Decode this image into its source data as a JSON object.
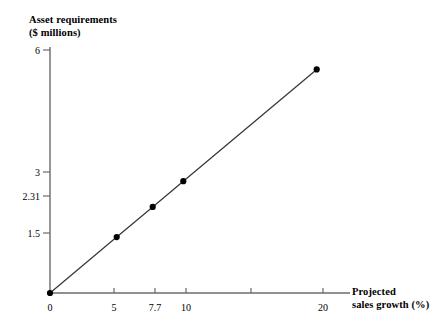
{
  "chart_data": {
    "type": "line",
    "title": "",
    "ylabel": "Asset requirements\n($ millions)",
    "ylabel_line1": "Asset requirements",
    "ylabel_line2": "($ millions)",
    "xlabel": "Projected\nsales growth (%)",
    "xlabel_line1": "Projected",
    "xlabel_line2": "sales growth (%)",
    "x": [
      0,
      5,
      7.7,
      10,
      20
    ],
    "values": [
      0,
      1.5,
      2.31,
      3,
      6
    ],
    "series": [
      {
        "name": "Asset requirements",
        "x": [
          0,
          5,
          7.7,
          10,
          20
        ],
        "values": [
          0,
          1.5,
          2.31,
          3,
          6
        ]
      }
    ],
    "points": [
      {
        "x": 0,
        "y": 0
      },
      {
        "x": 5,
        "y": 1.5
      },
      {
        "x": 7.7,
        "y": 2.31
      },
      {
        "x": 10,
        "y": 3
      },
      {
        "x": 20,
        "y": 6
      }
    ],
    "xlim": [
      0,
      22.5
    ],
    "ylim": [
      0,
      6.6
    ],
    "xticks": [
      0,
      5,
      7.7,
      10,
      15,
      20
    ],
    "xtick_labels": [
      "0",
      "5",
      "7.7",
      "10",
      "",
      "20"
    ],
    "yticks": [
      1.5,
      2.31,
      3,
      6
    ],
    "ytick_labels": [
      "1.5",
      "2.31",
      "3",
      "6"
    ],
    "grid": false,
    "legend": "none",
    "slope": 0.3,
    "line_color": "#3a3a3a",
    "marker_color": "#000000",
    "axis_color": "#6b6b6b",
    "background": "#ffffff"
  },
  "axis_titles": {
    "y_line1": "Asset requirements",
    "y_line2": "($ millions)",
    "x_line1": "Projected",
    "x_line2": "sales growth (%)"
  },
  "y_axis": {
    "ticks": [
      {
        "label": "6",
        "value": 6
      },
      {
        "label": "3",
        "value": 3
      },
      {
        "label": "2.31",
        "value": 2.31
      },
      {
        "label": "1.5",
        "value": 1.5
      }
    ]
  },
  "x_axis": {
    "ticks": [
      {
        "label": "0",
        "value": 0
      },
      {
        "label": "5",
        "value": 5
      },
      {
        "label": "7.7",
        "value": 7.7
      },
      {
        "label": "10",
        "value": 10
      },
      {
        "label": "",
        "value": 15
      },
      {
        "label": "20",
        "value": 20
      }
    ]
  }
}
